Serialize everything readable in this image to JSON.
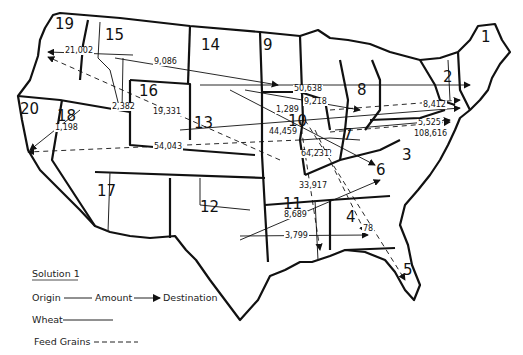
{
  "title": "Solution 1",
  "legend": {
    "title": "Solution 1",
    "origin_label": "Origin",
    "amount_label": "Amount",
    "destination_label": "Destination",
    "wheat_label": "Wheat",
    "feed_grains_label": "Feed Grains"
  },
  "regions": [
    {
      "id": "1",
      "x": 481,
      "y": 30
    },
    {
      "id": "2",
      "x": 443,
      "y": 70
    },
    {
      "id": "3",
      "x": 402,
      "y": 148
    },
    {
      "id": "4",
      "x": 346,
      "y": 210
    },
    {
      "id": "5",
      "x": 403,
      "y": 263
    },
    {
      "id": "6",
      "x": 376,
      "y": 163
    },
    {
      "id": "7",
      "x": 343,
      "y": 128
    },
    {
      "id": "8",
      "x": 357,
      "y": 83
    },
    {
      "id": "9",
      "x": 263,
      "y": 38
    },
    {
      "id": "10",
      "x": 288,
      "y": 114
    },
    {
      "id": "11",
      "x": 283,
      "y": 197
    },
    {
      "id": "12",
      "x": 200,
      "y": 200
    },
    {
      "id": "13",
      "x": 194,
      "y": 116
    },
    {
      "id": "14",
      "x": 201,
      "y": 38
    },
    {
      "id": "15",
      "x": 105,
      "y": 28
    },
    {
      "id": "16",
      "x": 139,
      "y": 84
    },
    {
      "id": "17",
      "x": 97,
      "y": 184
    },
    {
      "id": "18",
      "x": 57,
      "y": 109
    },
    {
      "id": "19",
      "x": 55,
      "y": 17
    },
    {
      "id": "20",
      "x": 20,
      "y": 102
    }
  ],
  "flows": [
    {
      "commodity": "Wheat",
      "origin": "15",
      "destination": "19",
      "amount": "21,002",
      "lx": 64,
      "ly": 47
    },
    {
      "commodity": "Wheat",
      "origin": "15",
      "destination": "9",
      "amount": "9,086",
      "lx": 153,
      "ly": 58
    },
    {
      "commodity": "Wheat",
      "origin": "15",
      "destination": "16",
      "amount": "2,382",
      "lx": 111,
      "ly": 103
    },
    {
      "commodity": "Feed Grains",
      "origin": "10",
      "destination": "19",
      "amount": "19,331",
      "lx": 152,
      "ly": 108
    },
    {
      "commodity": "Wheat",
      "origin": "15",
      "destination": "20",
      "amount": "1,198",
      "lx": 54,
      "ly": 124
    },
    {
      "commodity": "Feed Grains",
      "origin": "10",
      "destination": "20",
      "amount": "54,043",
      "lx": 153,
      "ly": 143
    },
    {
      "commodity": "Wheat",
      "origin": "14",
      "destination": "2",
      "amount": "50,638",
      "lx": 293,
      "ly": 85
    },
    {
      "commodity": "Wheat",
      "origin": "14",
      "destination": "8",
      "amount": "9,218",
      "lx": 303,
      "ly": 98
    },
    {
      "commodity": "Feed Grains",
      "origin": "10",
      "destination": "2",
      "amount": "8,412",
      "lx": 422,
      "ly": 101
    },
    {
      "commodity": "Wheat",
      "origin": "10",
      "destination": "3",
      "amount": "5,525",
      "lx": 417,
      "ly": 119
    },
    {
      "commodity": "Feed Grains",
      "origin": "10",
      "destination": "3",
      "amount": "108,616",
      "lx": 413,
      "ly": 130
    },
    {
      "commodity": "Wheat",
      "origin": "9",
      "destination": "7",
      "amount": "1,289",
      "lx": 275,
      "ly": 106
    },
    {
      "commodity": "Wheat",
      "origin": "10",
      "destination": "2",
      "amount": "44,459",
      "lx": 268,
      "ly": 128
    },
    {
      "commodity": "Wheat",
      "origin": "9",
      "destination": "6",
      "amount": "8,142",
      "lx": 308,
      "ly": 150
    },
    {
      "commodity": "Feed Grains",
      "origin": "10",
      "destination": "5",
      "amount": "64,231",
      "lx": 300,
      "ly": 150
    },
    {
      "commodity": "Feed Grains",
      "origin": "10",
      "destination": "4",
      "amount": "33,917",
      "lx": 298,
      "ly": 182
    },
    {
      "commodity": "Wheat",
      "origin": "12",
      "destination": "6",
      "amount": "8,689",
      "lx": 283,
      "ly": 211
    },
    {
      "commodity": "Wheat",
      "origin": "12",
      "destination": "4",
      "amount": "3,799",
      "lx": 284,
      "ly": 232
    },
    {
      "commodity": "Feed Grains",
      "origin": "10",
      "destination": "4",
      "amount": "78",
      "lx": 362,
      "ly": 225
    }
  ]
}
